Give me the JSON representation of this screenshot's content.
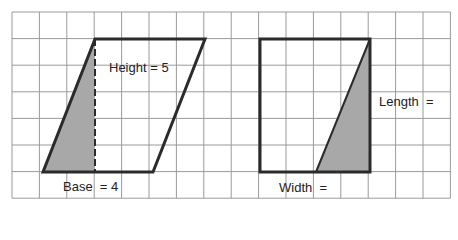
{
  "grid": {
    "x0": 12,
    "y0": 12,
    "cols": 16,
    "rows": 7,
    "cell_w": 27.4,
    "cell_h": 26.6,
    "line_color": "#9a9a9a"
  },
  "shapes": {
    "stroke_color": "#2b2b2b",
    "fill_color": "#a8a8a8",
    "parallelogram": {
      "points": [
        [
          95,
          39
        ],
        [
          205,
          39
        ],
        [
          153,
          172
        ],
        [
          43,
          172
        ]
      ],
      "shaded_triangle": [
        [
          95,
          39
        ],
        [
          95,
          172
        ],
        [
          43,
          172
        ]
      ],
      "height_line": [
        [
          95,
          39
        ],
        [
          95,
          172
        ]
      ]
    },
    "rectangle": {
      "x": 260,
      "y": 39,
      "w": 110,
      "h": 133,
      "shaded_triangle": [
        [
          370,
          39
        ],
        [
          370,
          172
        ],
        [
          316,
          172
        ]
      ]
    }
  },
  "labels": {
    "height": "Height = 5",
    "base": "Base  = 4",
    "length": "Length  =",
    "width": "Width  ="
  }
}
